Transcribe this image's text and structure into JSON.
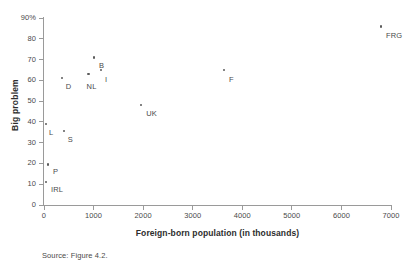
{
  "chart_data": {
    "type": "scatter",
    "title": "",
    "xlabel": "Foreign-born population (in thousands)",
    "ylabel": "Big problem",
    "xlim": [
      0,
      7000
    ],
    "ylim": [
      0,
      90
    ],
    "grid": false,
    "legend": "none",
    "xticks": [
      {
        "value": 0,
        "label": "0"
      },
      {
        "value": 1000,
        "label": "1000"
      },
      {
        "value": 2000,
        "label": "2000"
      },
      {
        "value": 3000,
        "label": "3000"
      },
      {
        "value": 4000,
        "label": "4000"
      },
      {
        "value": 5000,
        "label": "5000"
      },
      {
        "value": 6000,
        "label": "6000"
      },
      {
        "value": 7000,
        "label": "7000"
      }
    ],
    "yticks": [
      {
        "value": 90,
        "label": "90%"
      },
      {
        "value": 80,
        "label": "80"
      },
      {
        "value": 70,
        "label": "70"
      },
      {
        "value": 60,
        "label": "60"
      },
      {
        "value": 50,
        "label": "50"
      },
      {
        "value": 40,
        "label": "40"
      },
      {
        "value": 30,
        "label": "30"
      },
      {
        "value": 20,
        "label": "20"
      },
      {
        "value": 10,
        "label": "10"
      },
      {
        "value": 0,
        "label": "0"
      }
    ],
    "points": [
      {
        "label": "D",
        "x": 360,
        "y": 61,
        "label_dx": 4,
        "label_dy": 4
      },
      {
        "label": "B",
        "x": 1010,
        "y": 71,
        "label_dx": 5,
        "label_dy": 4
      },
      {
        "label": "I",
        "x": 1150,
        "y": 65,
        "label_dx": 4,
        "label_dy": 5
      },
      {
        "label": "NL",
        "x": 900,
        "y": 63,
        "label_dx": -2,
        "label_dy": 8
      },
      {
        "label": "UK",
        "x": 1960,
        "y": 48,
        "label_dx": 5,
        "label_dy": 4
      },
      {
        "label": "F",
        "x": 3630,
        "y": 65,
        "label_dx": 5,
        "label_dy": 5
      },
      {
        "label": "FRG",
        "x": 6800,
        "y": 86,
        "label_dx": 5,
        "label_dy": 5
      },
      {
        "label": "L",
        "x": 40,
        "y": 39,
        "label_dx": 3,
        "label_dy": 4
      },
      {
        "label": "S",
        "x": 400,
        "y": 35.5,
        "label_dx": 4,
        "label_dy": 4
      },
      {
        "label": "P",
        "x": 80,
        "y": 19.5,
        "label_dx": 5,
        "label_dy": 3
      },
      {
        "label": "IRL",
        "x": 40,
        "y": 11,
        "label_dx": 5,
        "label_dy": 3
      }
    ]
  },
  "source": {
    "text": "Source: Figure 4.2."
  },
  "colors": {
    "marker": "#5b5b5b",
    "axis": "#9a9a9a",
    "text": "#4a4a4a",
    "title_text": "#2d2d2d",
    "background": "#ffffff"
  }
}
